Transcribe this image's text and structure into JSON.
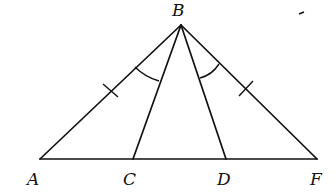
{
  "diagram": {
    "type": "geometry-triangle",
    "stroke_color": "#111111",
    "background": "#ffffff",
    "points": {
      "A": {
        "label": "A",
        "x": 40,
        "y": 159,
        "lx": 27,
        "ly": 185
      },
      "B": {
        "label": "B",
        "x": 181,
        "y": 25,
        "lx": 172,
        "ly": 16
      },
      "C": {
        "label": "C",
        "x": 133,
        "y": 159,
        "lx": 123,
        "ly": 185
      },
      "D": {
        "label": "D",
        "x": 226,
        "y": 159,
        "lx": 217,
        "ly": 185
      },
      "F": {
        "label": "F",
        "x": 317,
        "y": 159,
        "lx": 310,
        "ly": 185
      }
    },
    "segments": [
      "AB",
      "BF",
      "AF",
      "BC",
      "BD"
    ],
    "equal_segment_marks": [
      "AB",
      "BF"
    ],
    "equal_angle_marks": [
      "ABC",
      "DBF"
    ]
  }
}
